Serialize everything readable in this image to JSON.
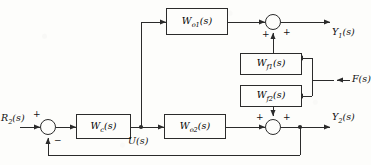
{
  "diagram": {
    "type": "control-block-diagram",
    "line_color": "#2b2b2b",
    "background_color": "#fdfdfb",
    "signals": {
      "reference": "R₂(s)",
      "reference_base": "R",
      "reference_sub": "2",
      "control": "U(s)",
      "disturbance": "F(s)",
      "output1": "Y₁(s)",
      "output1_base": "Y",
      "output1_sub": "1",
      "output2": "Y₂(s)",
      "output2_base": "Y",
      "output2_sub": "2"
    },
    "blocks": [
      {
        "id": "wo1",
        "base": "W",
        "sub": "o1",
        "label": "Wₒ₁(s)"
      },
      {
        "id": "wf1",
        "base": "W",
        "sub": "f1",
        "label": "Wₑ₁(s)"
      },
      {
        "id": "wf2",
        "base": "W",
        "sub": "f2",
        "label": "Wₑ₂(s)"
      },
      {
        "id": "wc",
        "base": "W",
        "sub": "c",
        "label": "Wс(s)"
      },
      {
        "id": "wo2",
        "base": "W",
        "sub": "o2",
        "label": "Wₒ₂(s)"
      }
    ],
    "summing_junctions": [
      {
        "id": "sum-left",
        "signs": {
          "top": "+",
          "bottom": "−"
        }
      },
      {
        "id": "sum-top-right",
        "signs": {
          "left": "+",
          "bottom": "+"
        }
      },
      {
        "id": "sum-bottom-right",
        "signs": {
          "left": "+",
          "right": "+"
        }
      }
    ],
    "signs": {
      "plus": "+",
      "minus": "−"
    }
  }
}
